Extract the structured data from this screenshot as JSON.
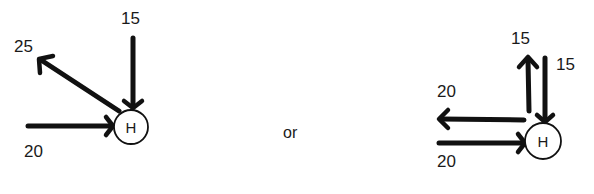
{
  "separator": {
    "text": "or"
  },
  "diagram_a": {
    "node": {
      "label": "H"
    },
    "arrows": [
      {
        "id": "in_top",
        "label": "15",
        "direction": "into-node"
      },
      {
        "id": "out_upleft",
        "label": "25",
        "direction": "out-of-node"
      },
      {
        "id": "in_left",
        "label": "20",
        "direction": "into-node"
      }
    ]
  },
  "diagram_b": {
    "node": {
      "label": "H"
    },
    "arrows": [
      {
        "id": "out_up",
        "label": "15",
        "direction": "out-of-node"
      },
      {
        "id": "in_top",
        "label": "15",
        "direction": "into-node"
      },
      {
        "id": "out_left",
        "label": "20",
        "direction": "out-of-node"
      },
      {
        "id": "in_left",
        "label": "20",
        "direction": "into-node"
      }
    ]
  }
}
